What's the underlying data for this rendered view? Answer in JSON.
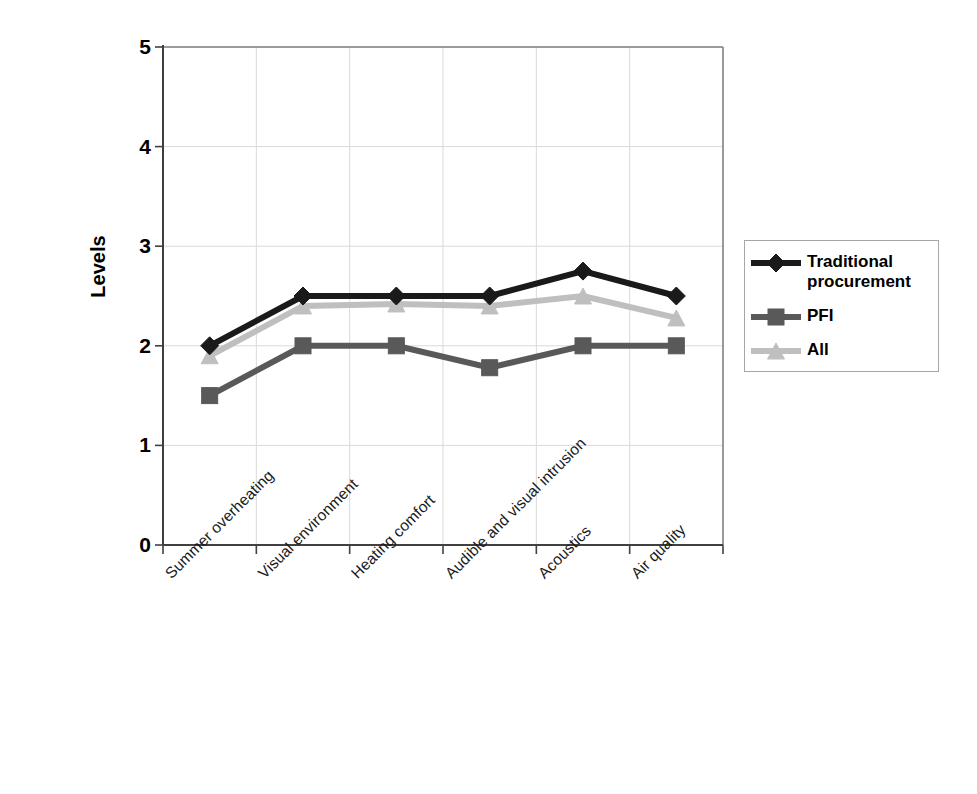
{
  "chart_data": {
    "type": "line",
    "title": "",
    "xlabel": "",
    "ylabel": "Levels",
    "ylim": [
      0,
      5
    ],
    "yticks": [
      "0",
      "1",
      "2",
      "3",
      "4",
      "5"
    ],
    "grid": true,
    "legend_position": "right",
    "categories": [
      "Summer overheating",
      "Visual environment",
      "Heating comfort",
      "Audible and visual intrusion",
      "Acoustics",
      "Air quality"
    ],
    "series": [
      {
        "name": "Traditional procurement",
        "color": "#1a1a1a",
        "marker": "diamond",
        "values": [
          2.0,
          2.5,
          2.5,
          2.5,
          2.75,
          2.5
        ]
      },
      {
        "name": "PFI",
        "color": "#595959",
        "marker": "square",
        "values": [
          1.5,
          2.0,
          2.0,
          1.78,
          2.0,
          2.0
        ]
      },
      {
        "name": "All",
        "color": "#bfbfbf",
        "marker": "triangle",
        "values": [
          1.9,
          2.4,
          2.42,
          2.4,
          2.5,
          2.28
        ]
      }
    ]
  },
  "legend": {
    "items": [
      {
        "label": "Traditional\nprocurement",
        "marker": "diamond",
        "color": "#1a1a1a"
      },
      {
        "label": "PFI",
        "marker": "square",
        "color": "#595959"
      },
      {
        "label": "All",
        "marker": "triangle",
        "color": "#bfbfbf"
      }
    ]
  },
  "axes": {
    "y_title": "Levels",
    "y_ticks": [
      "5",
      "4",
      "3",
      "2",
      "1",
      "0"
    ]
  }
}
